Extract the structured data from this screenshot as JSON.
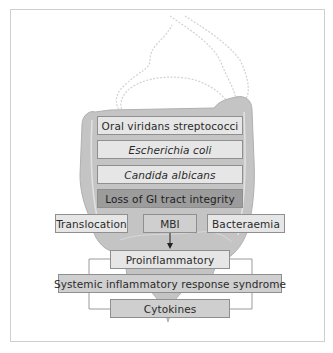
{
  "diagram": {
    "organisms": [
      {
        "label": "Oral viridans streptococci",
        "italic": false
      },
      {
        "label": "Escherichia coli",
        "italic": true
      },
      {
        "label": "Candida albicans",
        "italic": true
      }
    ],
    "event": "Loss of GI tract integrity",
    "mechanisms": {
      "left": "Translocation",
      "center": "MBI",
      "right": "Bacteraemia"
    },
    "cascade": [
      "Proinflammatory",
      "Systemic inflammatory response syndrome",
      "Cytokines"
    ],
    "colors": {
      "light_box": "#e6e6e6",
      "mid_box": "#cfcfcf",
      "dark_box": "#9c9c9c",
      "intestine": "#c4c4c4",
      "stomach_outline": "#d2d2d2"
    }
  }
}
